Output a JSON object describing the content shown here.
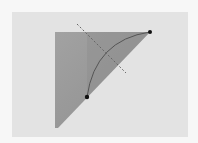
{
  "diagram": {
    "colors": {
      "page_background": "#f7f7f7",
      "panel_background": "#e3e3e3",
      "triangle_fill": "#9a9a9a",
      "triangle_fill_dark": "#8a8a8a",
      "arc_stroke": "#555555",
      "dashed_line": "#666666",
      "point_fill": "#111111"
    },
    "elements": {
      "triangle": "right triangle",
      "arc": "circular arc connecting two points",
      "bisector": "dashed line",
      "points": [
        "top-right vertex",
        "point on hypotenuse"
      ]
    }
  }
}
